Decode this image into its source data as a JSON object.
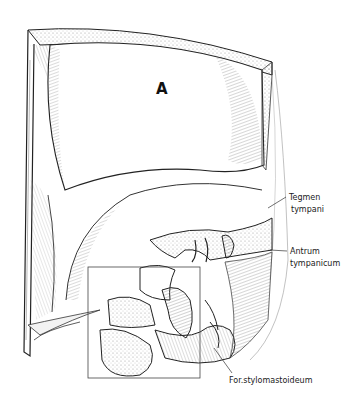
{
  "figure": {
    "type": "anatomical-illustration",
    "ink_color": "#1e1e1e",
    "hatch_color": "#555555",
    "background": "#ffffff"
  },
  "labels": {
    "region_a": "A",
    "tegmen_line1": "Tegmen",
    "tegmen_line2": "tympani",
    "antrum_line1": "Antrum",
    "antrum_line2": "tympanicum",
    "foramen": "For.stylomastoideum"
  },
  "inset_box": {
    "x": 88,
    "y": 267,
    "width": 112,
    "height": 111
  }
}
